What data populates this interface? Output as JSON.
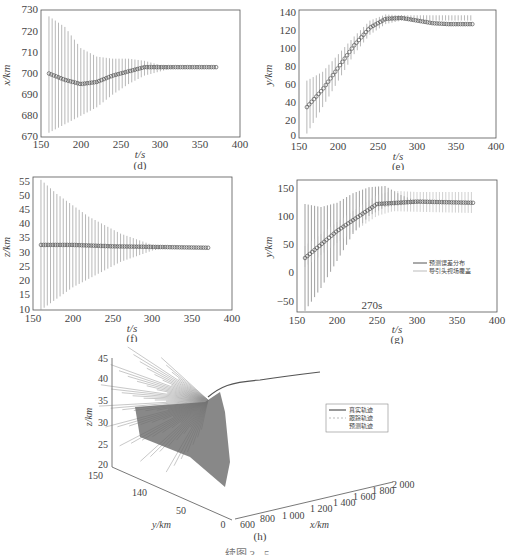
{
  "chart_data": [
    {
      "id": "d",
      "type": "scatter",
      "title": "",
      "panel_label": "(d)",
      "xlabel": "t/s",
      "ylabel": "x/km",
      "xlim": [
        150,
        400
      ],
      "ylim": [
        670,
        730
      ],
      "xticks": [
        150,
        200,
        250,
        300,
        350,
        400
      ],
      "yticks": [
        670,
        680,
        690,
        700,
        710,
        720,
        730
      ],
      "series": [
        {
          "name": "estimate",
          "x": [
            160,
            180,
            200,
            220,
            240,
            260,
            280,
            300,
            320,
            340,
            370
          ],
          "values": [
            700,
            697,
            695,
            696,
            699,
            701,
            703,
            703,
            703,
            703,
            703
          ]
        },
        {
          "name": "error_upper",
          "x": [
            160,
            180,
            200,
            220,
            240,
            260,
            280,
            300,
            320
          ],
          "values": [
            727,
            722,
            712,
            708,
            707,
            707,
            706,
            704,
            703
          ]
        },
        {
          "name": "error_lower",
          "x": [
            160,
            180,
            200,
            220,
            240,
            260,
            280,
            300,
            320
          ],
          "values": [
            672,
            676,
            680,
            684,
            690,
            695,
            699,
            701,
            703
          ]
        }
      ],
      "grid": false
    },
    {
      "id": "e",
      "type": "scatter",
      "panel_label": "(e)",
      "xlabel": "t/s",
      "ylabel": "y/km",
      "xlim": [
        150,
        400
      ],
      "ylim": [
        -5,
        140
      ],
      "xticks": [
        150,
        200,
        250,
        300,
        350,
        400
      ],
      "yticks": [
        0,
        20,
        40,
        60,
        80,
        100,
        120,
        140
      ],
      "series": [
        {
          "name": "estimate",
          "x": [
            160,
            180,
            200,
            220,
            240,
            260,
            280,
            300,
            320,
            340,
            370
          ],
          "values": [
            30,
            50,
            75,
            100,
            120,
            130,
            131,
            128,
            125,
            124,
            124
          ]
        },
        {
          "name": "error_upper",
          "x": [
            160,
            180,
            200,
            220,
            240,
            260,
            280
          ],
          "values": [
            60,
            70,
            90,
            110,
            128,
            135,
            134
          ]
        },
        {
          "name": "error_lower",
          "x": [
            160,
            180,
            200,
            220,
            240,
            260,
            280
          ],
          "values": [
            0,
            30,
            60,
            90,
            112,
            124,
            128
          ]
        }
      ],
      "grid": false
    },
    {
      "id": "f",
      "type": "scatter",
      "panel_label": "(f)",
      "xlabel": "t/s",
      "ylabel": "z/km",
      "xlim": [
        150,
        400
      ],
      "ylim": [
        10,
        57
      ],
      "xticks": [
        150,
        200,
        250,
        300,
        350,
        400
      ],
      "yticks": [
        10,
        15,
        20,
        25,
        30,
        35,
        40,
        45,
        50,
        55
      ],
      "series": [
        {
          "name": "estimate",
          "x": [
            160,
            200,
            250,
            300,
            370
          ],
          "values": [
            33,
            33,
            32.5,
            32.3,
            32
          ]
        },
        {
          "name": "error_upper",
          "x": [
            160,
            180,
            200,
            220,
            240,
            260,
            280,
            300,
            320
          ],
          "values": [
            56,
            51,
            47,
            43,
            40,
            37,
            35,
            33,
            32
          ]
        },
        {
          "name": "error_lower",
          "x": [
            160,
            180,
            200,
            220,
            240,
            260,
            280,
            300,
            320
          ],
          "values": [
            10,
            14,
            18,
            21,
            24,
            27,
            29,
            31,
            32
          ]
        }
      ],
      "grid": false
    },
    {
      "id": "g",
      "type": "scatter",
      "panel_label": "(g)",
      "xlabel": "t/s",
      "ylabel": "y/km",
      "xlim": [
        150,
        400
      ],
      "ylim": [
        -60,
        160
      ],
      "xticks": [
        150,
        200,
        250,
        300,
        350,
        400
      ],
      "yticks": [
        -50,
        0,
        50,
        100,
        150
      ],
      "annotation": "270s",
      "legend": [
        "预测误差分布",
        "导引头视场覆盖"
      ],
      "legend_position": "right-middle",
      "series": [
        {
          "name": "预测误差分布_upper",
          "x": [
            160,
            180,
            200,
            220,
            240,
            260,
            280,
            300
          ],
          "values": [
            120,
            115,
            122,
            138,
            148,
            150,
            135,
            125
          ]
        },
        {
          "name": "预测误差分布_lower",
          "x": [
            160,
            180,
            200,
            220,
            240,
            260,
            280,
            300
          ],
          "values": [
            -58,
            -20,
            25,
            70,
            100,
            115,
            118,
            120
          ]
        },
        {
          "name": "导引头视场覆盖_upper",
          "x": [
            160,
            200,
            250,
            270,
            300,
            370
          ],
          "values": [
            50,
            90,
            135,
            142,
            140,
            140
          ]
        },
        {
          "name": "导引头视场覆盖_lower",
          "x": [
            160,
            200,
            250,
            270,
            300,
            370
          ],
          "values": [
            15,
            55,
            100,
            108,
            107,
            105
          ]
        },
        {
          "name": "estimate",
          "x": [
            160,
            200,
            250,
            300,
            370
          ],
          "values": [
            30,
            75,
            120,
            124,
            122
          ]
        }
      ],
      "grid": false
    },
    {
      "id": "h",
      "type": "line",
      "panel_label": "(h)",
      "xlabel": "x/km",
      "ylabel": "y/km",
      "zlabel": "z/km",
      "xticks": [
        600,
        800,
        1000,
        1200,
        1400,
        1600,
        1800,
        2000
      ],
      "yticks": [
        0,
        50,
        140,
        150
      ],
      "zticks": [
        20,
        25,
        30,
        35,
        40,
        45
      ],
      "legend": [
        "真实轨迹",
        "跟踪轨迹",
        "预测轨迹"
      ],
      "legend_position": "right",
      "series": [
        {
          "name": "真实轨迹",
          "style": "solid"
        },
        {
          "name": "跟踪轨迹",
          "style": "dashed"
        },
        {
          "name": "预测轨迹",
          "style": "thin"
        }
      ]
    }
  ],
  "labels": {
    "d": "(d)",
    "e": "(e)",
    "f": "(f)",
    "g": "(g)",
    "h": "(h)",
    "t_axis": "t/s",
    "x_axis": "x/km",
    "y_axis": "y/km",
    "z_axis": "z/km",
    "g_annotation": "270s",
    "g_legend_1": "预测误差分布",
    "g_legend_2": "导引头视场覆盖",
    "h_legend_1": "真实轨迹",
    "h_legend_2": "跟踪轨迹",
    "h_legend_3": "预测轨迹",
    "caption": "续图 3 - 5  …"
  },
  "colors": {
    "axis": "#555555",
    "errorbar": "#888888",
    "marker": "#555555",
    "fov": "#bbbbbb"
  }
}
